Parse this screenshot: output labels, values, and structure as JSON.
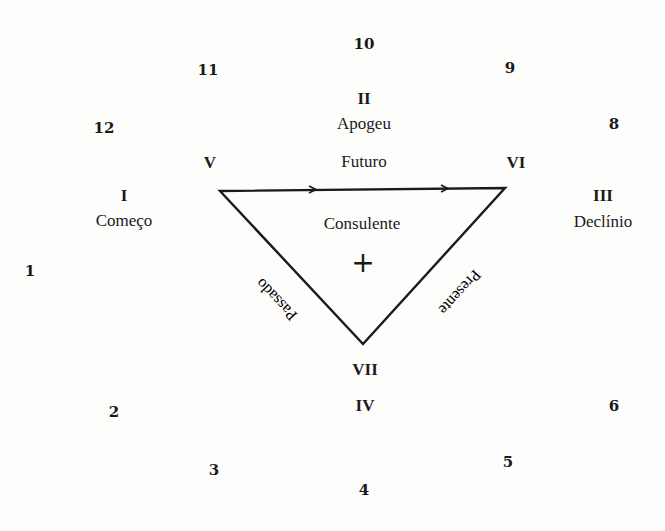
{
  "outer_numbers": [
    {
      "label": "10",
      "x": 364,
      "y": 44
    },
    {
      "label": "11",
      "x": 208,
      "y": 70
    },
    {
      "label": "9",
      "x": 510,
      "y": 68
    },
    {
      "label": "12",
      "x": 104,
      "y": 128
    },
    {
      "label": "8",
      "x": 614,
      "y": 124
    },
    {
      "label": "1",
      "x": 30,
      "y": 271
    },
    {
      "label": "2",
      "x": 114,
      "y": 412
    },
    {
      "label": "6",
      "x": 614,
      "y": 406
    },
    {
      "label": "3",
      "x": 214,
      "y": 470
    },
    {
      "label": "5",
      "x": 508,
      "y": 462
    },
    {
      "label": "4",
      "x": 364,
      "y": 490
    }
  ],
  "sectors": [
    {
      "numeral": "I",
      "name": "Começo",
      "x": 124
    },
    {
      "numeral": "II",
      "name": "Apogeu"
    },
    {
      "numeral": "III",
      "name": "Declínio"
    },
    {
      "numeral": "IV",
      "name": ""
    }
  ],
  "vertices": {
    "left": "V",
    "right": "VI",
    "bottom": "VII"
  },
  "triangle": {
    "center_label": "Consulente",
    "center_mark": "+",
    "top_side": "Futuro",
    "left_side": "Passado",
    "right_side": "Presente"
  }
}
